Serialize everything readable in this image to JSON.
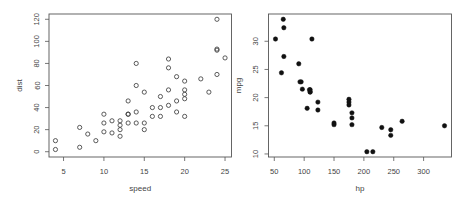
{
  "chart_data": [
    {
      "type": "scatter",
      "title": "",
      "xlabel": "speed",
      "ylabel": "dist",
      "marker": "open-circle",
      "xlim": [
        3.2,
        25.8
      ],
      "ylim": [
        -4.8,
        124.8
      ],
      "xticks": [
        5,
        10,
        15,
        20,
        25
      ],
      "yticks": [
        0,
        20,
        40,
        60,
        80,
        100,
        120
      ],
      "grid": false,
      "legend": null,
      "x": [
        4,
        4,
        7,
        7,
        8,
        9,
        10,
        10,
        10,
        11,
        11,
        12,
        12,
        12,
        12,
        13,
        13,
        13,
        13,
        14,
        14,
        14,
        14,
        15,
        15,
        15,
        16,
        16,
        17,
        17,
        17,
        18,
        18,
        18,
        18,
        19,
        19,
        19,
        20,
        20,
        20,
        20,
        20,
        22,
        23,
        24,
        24,
        24,
        24,
        25
      ],
      "y": [
        2,
        10,
        4,
        22,
        16,
        10,
        18,
        26,
        34,
        17,
        28,
        14,
        20,
        24,
        28,
        26,
        34,
        34,
        46,
        26,
        36,
        60,
        80,
        20,
        26,
        54,
        32,
        40,
        32,
        40,
        50,
        42,
        56,
        76,
        84,
        36,
        46,
        68,
        32,
        48,
        52,
        56,
        64,
        66,
        54,
        70,
        92,
        93,
        120,
        85
      ]
    },
    {
      "type": "scatter",
      "title": "",
      "xlabel": "hp",
      "ylabel": "mpg",
      "marker": "filled-circle",
      "xlim": [
        40.3,
        346.7
      ],
      "ylim": [
        9.46,
        34.84
      ],
      "xticks": [
        50,
        100,
        150,
        200,
        250,
        300
      ],
      "yticks": [
        10,
        15,
        20,
        25,
        30
      ],
      "grid": false,
      "legend": null,
      "x": [
        110,
        110,
        93,
        110,
        175,
        105,
        245,
        62,
        95,
        123,
        123,
        180,
        180,
        180,
        205,
        215,
        230,
        66,
        52,
        65,
        97,
        150,
        150,
        245,
        175,
        66,
        91,
        113,
        264,
        175,
        335,
        109
      ],
      "y": [
        21.0,
        21.0,
        22.8,
        21.4,
        18.7,
        18.1,
        14.3,
        24.4,
        22.8,
        19.2,
        17.8,
        16.4,
        17.3,
        15.2,
        10.4,
        10.4,
        14.7,
        32.4,
        30.4,
        33.9,
        21.5,
        15.5,
        15.2,
        13.3,
        19.2,
        27.3,
        26.0,
        30.4,
        15.8,
        19.7,
        15.0,
        21.4
      ]
    }
  ],
  "panels": [
    {
      "xlabel": "speed",
      "ylabel": "dist",
      "xtick_labels": [
        "5",
        "10",
        "15",
        "20",
        "25"
      ],
      "ytick_labels": [
        "0",
        "20",
        "40",
        "60",
        "80",
        "100",
        "120"
      ]
    },
    {
      "xlabel": "hp",
      "ylabel": "mpg",
      "xtick_labels": [
        "50",
        "100",
        "150",
        "200",
        "250",
        "300"
      ],
      "ytick_labels": [
        "10",
        "15",
        "20",
        "25",
        "30"
      ]
    }
  ]
}
